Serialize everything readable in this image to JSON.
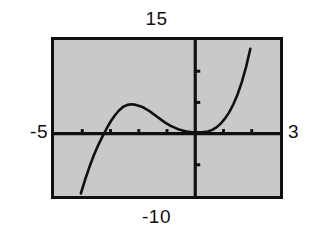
{
  "figure": {
    "kind": "graphing-calculator-screen",
    "background_color": "#ffffff",
    "screen_fill": "#c9c9c9",
    "ink_color": "#101010",
    "labels": {
      "top": "15",
      "bottom": "-10",
      "left": "-5",
      "right": "3"
    }
  },
  "chart_data": {
    "type": "line",
    "title": "",
    "xlabel": "",
    "ylabel": "",
    "xlim": [
      -5,
      3
    ],
    "ylim": [
      -10,
      15
    ],
    "xtick_step": 1,
    "ytick_step": 5,
    "grid": false,
    "legend": null,
    "axis_labels": {
      "xmin": "-5",
      "xmax": "3",
      "ymin": "-10",
      "ymax": "15"
    },
    "series": [
      {
        "name": "cubic",
        "comment": "Cubic curve: rises from below-left, local max near x=-2.4, local min near x=0.5 just above the x-axis, then rises off the top-right.",
        "x": [
          -4.05,
          -3.9,
          -3.75,
          -3.6,
          -3.45,
          -3.3,
          -3.15,
          -3.0,
          -2.85,
          -2.7,
          -2.55,
          -2.4,
          -2.25,
          -2.1,
          -1.95,
          -1.8,
          -1.65,
          -1.5,
          -1.35,
          -1.2,
          -1.05,
          -0.9,
          -0.75,
          -0.6,
          -0.45,
          -0.3,
          -0.15,
          0.0,
          0.15,
          0.3,
          0.45,
          0.6,
          0.75,
          0.9,
          1.05,
          1.2,
          1.35,
          1.5,
          1.65,
          1.8,
          1.95
        ],
        "y": [
          -9.6,
          -7.4,
          -5.4,
          -3.6,
          -2.0,
          -0.6,
          0.7,
          1.9,
          2.9,
          3.7,
          4.3,
          4.6,
          4.7,
          4.6,
          4.4,
          4.1,
          3.7,
          3.2,
          2.7,
          2.2,
          1.7,
          1.3,
          1.0,
          0.7,
          0.5,
          0.35,
          0.25,
          0.2,
          0.2,
          0.25,
          0.35,
          0.6,
          1.0,
          1.6,
          2.4,
          3.4,
          4.7,
          6.3,
          8.3,
          10.7,
          13.6
        ]
      }
    ],
    "xticks": [
      -4,
      -3,
      -2,
      -1,
      0,
      1,
      2
    ],
    "yticks": [
      -5,
      0,
      5,
      10
    ]
  }
}
